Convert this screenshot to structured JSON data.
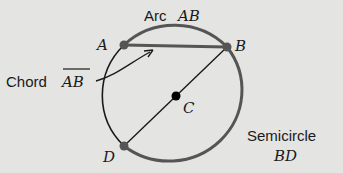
{
  "colors": {
    "background": "#e4e4e2",
    "thin_stroke": "#1a1a1a",
    "accent_stroke": "#555555",
    "point_fill_gray": "#555555",
    "point_fill_black": "#000000"
  },
  "labels": {
    "arc_word": "Arc",
    "arc_name": "AB",
    "chord_word": "Chord",
    "chord_name": "AB",
    "semicircle_word": "Semicircle",
    "semicircle_name": "BD",
    "point_a": "A",
    "point_b": "B",
    "point_c": "C",
    "point_d": "D"
  }
}
